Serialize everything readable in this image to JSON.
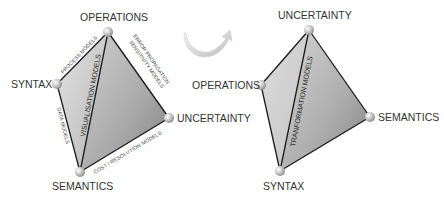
{
  "left_tetrahedron": {
    "vertices": {
      "operations": "OPERATIONS",
      "syntax": "SYNTAX",
      "uncertainty": "UNCERTAINTY",
      "semantics": "SEMANTICS"
    },
    "edge_labels": {
      "syntax_operations": "PROCESS MODELS",
      "operations_uncertainty_1": "ERROR PROPAGATION",
      "operations_uncertainty_2": "SENSITIVITY MODELS",
      "syntax_semantics": "DATA MODELS",
      "semantics_uncertainty": "COST / RESOLUTION MODELS"
    },
    "face_label": "VISUALISATION MODELS"
  },
  "transition": {
    "icon": "curved-arrow-icon"
  },
  "right_tetrahedron": {
    "vertices": {
      "uncertainty": "UNCERTAINTY",
      "operations": "OPERATIONS",
      "semantics": "SEMANTICS",
      "syntax": "SYNTAX"
    },
    "face_label": "TRANFORMATION MODELS"
  },
  "colors": {
    "edge": "#1a1a1a",
    "node": "#c8c8c8",
    "face_light": "#e6e6e6",
    "face_dark": "#8a8a8a"
  }
}
